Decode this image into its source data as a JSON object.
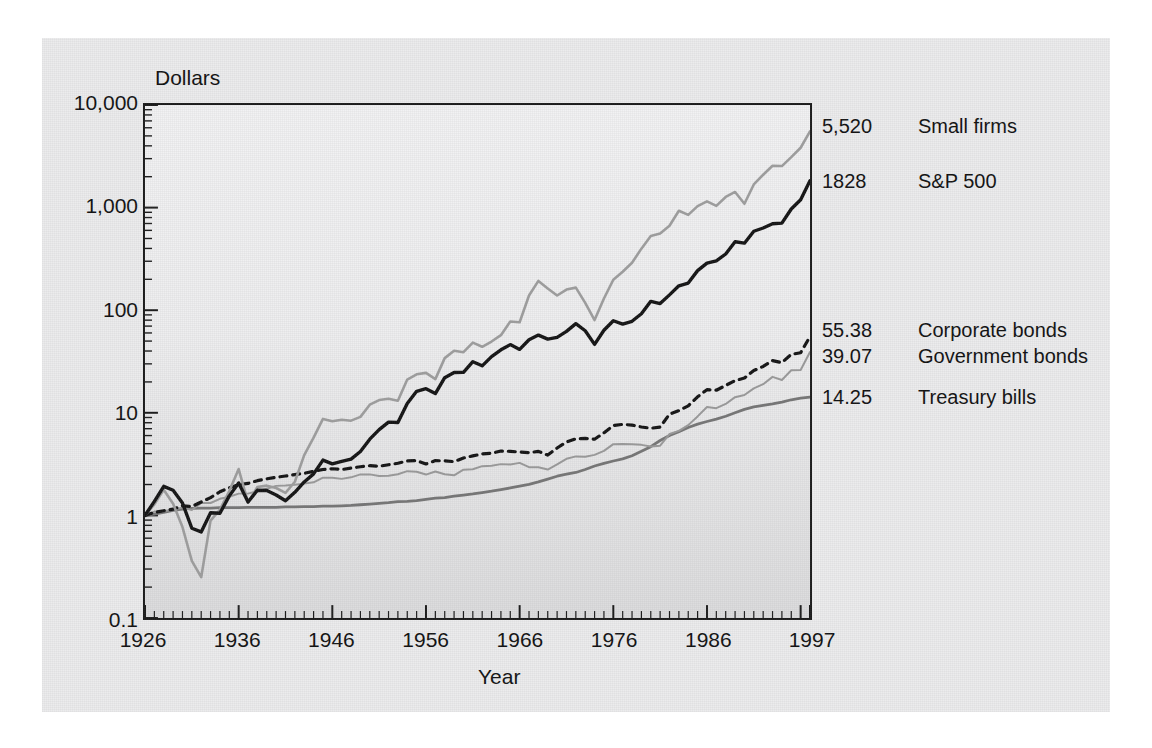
{
  "chart_data": {
    "type": "line",
    "title": "",
    "xlabel": "Year",
    "ylabel": "Dollars",
    "scale": "log",
    "grid": false,
    "legend_position": "right",
    "xlim": [
      1926,
      1997
    ],
    "ylim": [
      0.1,
      10000
    ],
    "xticks": [
      "1926",
      "1936",
      "1946",
      "1956",
      "1966",
      "1976",
      "1986",
      "1997"
    ],
    "xtick_values": [
      1926,
      1936,
      1946,
      1956,
      1966,
      1976,
      1986,
      1997
    ],
    "yticks": [
      "0.1",
      "1",
      "10",
      "100",
      "1,000",
      "10,000"
    ],
    "ytick_values": [
      0.1,
      1,
      10,
      100,
      1000,
      10000
    ],
    "x": [
      1926,
      1927,
      1928,
      1929,
      1930,
      1931,
      1932,
      1933,
      1934,
      1935,
      1936,
      1937,
      1938,
      1939,
      1940,
      1941,
      1942,
      1943,
      1944,
      1945,
      1946,
      1947,
      1948,
      1949,
      1950,
      1951,
      1952,
      1953,
      1954,
      1955,
      1956,
      1957,
      1958,
      1959,
      1960,
      1961,
      1962,
      1963,
      1964,
      1965,
      1966,
      1967,
      1968,
      1969,
      1970,
      1971,
      1972,
      1973,
      1974,
      1975,
      1976,
      1977,
      1978,
      1979,
      1980,
      1981,
      1982,
      1983,
      1984,
      1985,
      1986,
      1987,
      1988,
      1989,
      1990,
      1991,
      1992,
      1993,
      1994,
      1995,
      1996,
      1997
    ],
    "series": [
      {
        "name": "Small firms",
        "end_value": 5520,
        "end_label": "5,520",
        "color": "#9e9e9e",
        "style": "solid-light",
        "values": [
          1.0,
          1.28,
          1.78,
          1.3,
          0.77,
          0.36,
          0.25,
          0.89,
          1.14,
          1.73,
          2.83,
          1.33,
          1.89,
          1.95,
          1.85,
          1.66,
          2.13,
          3.87,
          5.72,
          8.72,
          8.27,
          8.56,
          8.38,
          9.12,
          12.0,
          13.3,
          13.7,
          13.1,
          21.1,
          23.7,
          24.5,
          21.3,
          34.1,
          40.2,
          39.0,
          48.3,
          44.0,
          49.5,
          57.1,
          77.6,
          76.3,
          139.0,
          193.0,
          163.0,
          139.0,
          159.0,
          166.0,
          118.0,
          80.1,
          130.0,
          198.0,
          237.0,
          290.0,
          398.0,
          530.0,
          559.0,
          666.0,
          932.0,
          849.0,
          1035.0,
          1150.0,
          1040.0,
          1270.0,
          1420.0,
          1090.0,
          1680.0,
          2090.0,
          2560.0,
          2540.0,
          3100.0,
          3830.0,
          5520.0
        ]
      },
      {
        "name": "S&P 500",
        "end_value": 1828,
        "end_label": "1828",
        "color": "#141414",
        "style": "solid-bold",
        "values": [
          1.0,
          1.37,
          1.92,
          1.76,
          1.32,
          0.75,
          0.69,
          1.06,
          1.05,
          1.55,
          2.07,
          1.35,
          1.76,
          1.75,
          1.58,
          1.39,
          1.68,
          2.12,
          2.54,
          3.46,
          3.18,
          3.36,
          3.54,
          4.2,
          5.53,
          6.86,
          8.12,
          8.04,
          12.3,
          16.2,
          17.2,
          15.4,
          22.0,
          24.7,
          24.8,
          31.5,
          28.7,
          35.3,
          41.1,
          46.2,
          41.5,
          51.5,
          57.2,
          52.3,
          54.4,
          62.2,
          74.0,
          63.1,
          46.4,
          63.7,
          78.9,
          73.2,
          78.0,
          92.4,
          122.0,
          116.0,
          141.0,
          173.0,
          184.0,
          243.0,
          288.0,
          303.0,
          353.0,
          465.0,
          450.0,
          588.0,
          633.0,
          696.0,
          705.0,
          970.0,
          1193.0,
          1828.0
        ]
      },
      {
        "name": "Corporate bonds",
        "end_value": 55.38,
        "end_label": "55.38",
        "color": "#141414",
        "style": "dotted",
        "values": [
          1.0,
          1.07,
          1.11,
          1.15,
          1.24,
          1.22,
          1.35,
          1.49,
          1.7,
          1.86,
          1.99,
          2.05,
          2.18,
          2.27,
          2.35,
          2.42,
          2.5,
          2.57,
          2.69,
          2.8,
          2.85,
          2.8,
          2.89,
          2.98,
          3.05,
          3.01,
          3.12,
          3.22,
          3.4,
          3.42,
          3.17,
          3.42,
          3.4,
          3.34,
          3.63,
          3.8,
          3.97,
          4.03,
          4.24,
          4.21,
          4.14,
          4.08,
          4.21,
          3.87,
          4.54,
          5.19,
          5.58,
          5.63,
          5.53,
          6.38,
          7.53,
          7.71,
          7.59,
          7.28,
          7.07,
          7.26,
          9.7,
          10.5,
          11.7,
          14.3,
          16.8,
          16.6,
          18.5,
          20.6,
          21.8,
          25.8,
          28.3,
          32.3,
          30.8,
          37.1,
          38.5,
          55.38
        ]
      },
      {
        "name": "Government bonds",
        "end_value": 39.07,
        "end_label": "39.07",
        "color": "#9a9a9a",
        "style": "solid-thin",
        "values": [
          1.0,
          1.09,
          1.1,
          1.14,
          1.19,
          1.13,
          1.32,
          1.32,
          1.45,
          1.52,
          1.63,
          1.63,
          1.72,
          1.82,
          1.94,
          1.96,
          1.99,
          2.04,
          2.1,
          2.33,
          2.33,
          2.27,
          2.35,
          2.51,
          2.51,
          2.42,
          2.44,
          2.52,
          2.7,
          2.66,
          2.5,
          2.68,
          2.52,
          2.46,
          2.79,
          2.82,
          3.02,
          3.05,
          3.16,
          3.14,
          3.25,
          2.95,
          2.95,
          2.8,
          3.14,
          3.56,
          3.76,
          3.73,
          3.89,
          4.25,
          4.95,
          4.97,
          4.93,
          4.87,
          4.69,
          4.78,
          6.21,
          6.67,
          7.58,
          9.22,
          11.4,
          11.1,
          12.2,
          14.2,
          14.9,
          17.3,
          19.0,
          22.4,
          20.9,
          26.0,
          26.1,
          39.07
        ]
      },
      {
        "name": "Treasury bills",
        "end_value": 14.25,
        "end_label": "14.25",
        "color": "#767676",
        "style": "solid-smooth",
        "values": [
          1.0,
          1.03,
          1.07,
          1.12,
          1.15,
          1.17,
          1.18,
          1.18,
          1.19,
          1.19,
          1.19,
          1.2,
          1.2,
          1.2,
          1.2,
          1.21,
          1.21,
          1.22,
          1.22,
          1.23,
          1.23,
          1.24,
          1.25,
          1.27,
          1.29,
          1.31,
          1.33,
          1.36,
          1.37,
          1.39,
          1.43,
          1.47,
          1.49,
          1.54,
          1.58,
          1.62,
          1.67,
          1.72,
          1.78,
          1.85,
          1.93,
          2.01,
          2.12,
          2.26,
          2.41,
          2.52,
          2.62,
          2.8,
          3.03,
          3.22,
          3.39,
          3.56,
          3.81,
          4.21,
          4.68,
          5.37,
          6.02,
          6.55,
          7.2,
          7.76,
          8.23,
          8.68,
          9.26,
          10.0,
          10.8,
          11.4,
          11.8,
          12.2,
          12.7,
          13.4,
          13.9,
          14.25
        ]
      }
    ]
  },
  "axes": {
    "y_title": "Dollars",
    "x_title": "Year"
  },
  "legend": {
    "entries": [
      {
        "value": "5,520",
        "name": "Small firms"
      },
      {
        "value": "1828",
        "name": "S&P 500"
      },
      {
        "value": "55.38",
        "name": "Corporate bonds"
      },
      {
        "value": "39.07",
        "name": "Government bonds"
      },
      {
        "value": "14.25",
        "name": "Treasury bills"
      }
    ]
  }
}
